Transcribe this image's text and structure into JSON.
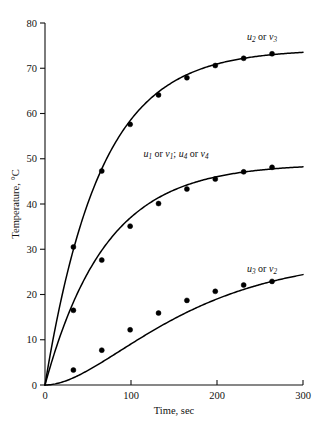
{
  "chart_data": {
    "type": "line",
    "title": "",
    "xlabel": "Time, sec",
    "ylabel": "Temperature, °C",
    "xlim": [
      0,
      300
    ],
    "ylim": [
      0,
      80
    ],
    "xticks": [
      0,
      100,
      200,
      300
    ],
    "xtick_labels": [
      "0",
      "100",
      "200",
      "300"
    ],
    "yticks": [
      0,
      10,
      20,
      30,
      40,
      50,
      60,
      70,
      80
    ],
    "ytick_labels": [
      "0",
      "10",
      "20",
      "30",
      "40",
      "50",
      "60",
      "70",
      "80"
    ],
    "grid": false,
    "legend": "inline-curve-labels",
    "marker": "filled-circle",
    "series": [
      {
        "name": "u2 or v3",
        "label_html": "<tspan class=\"curve-label\">u</tspan><tspan class=\"sub\" dy=\"2.2\">2</tspan><tspan class=\"conj\" dy=\"-2.2\"> or </tspan><tspan>v</tspan><tspan class=\"sub\" dy=\"2.2\">3</tspan>",
        "label_x": 262,
        "label_y": 40,
        "plateau": 74.2,
        "x": [
          0,
          33,
          66,
          99,
          132,
          165,
          198,
          231,
          264
        ],
        "y": [
          0,
          30.5,
          47.3,
          57.6,
          64.1,
          67.9,
          70.6,
          72.2,
          73.2
        ]
      },
      {
        "name": "u1 or v1; u4 or v4",
        "label_html": "<tspan>u</tspan><tspan class=\"sub\" dy=\"2.2\">1</tspan><tspan class=\"conj\" dy=\"-2.2\"> or </tspan><tspan>v</tspan><tspan class=\"sub\" dy=\"2.2\">1</tspan><tspan class=\"conj\" dy=\"-2.2\">; </tspan><tspan>u</tspan><tspan class=\"sub\" dy=\"2.2\">4</tspan><tspan class=\"conj\" dy=\"-2.2\"> or </tspan><tspan>v</tspan><tspan class=\"sub\" dy=\"2.2\">4</tspan>",
        "label_x": 176,
        "label_y": 157,
        "plateau": 48.9,
        "x": [
          0,
          33,
          66,
          99,
          132,
          165,
          198,
          231,
          264
        ],
        "y": [
          0,
          16.5,
          27.6,
          35.1,
          40.1,
          43.3,
          45.5,
          47.1,
          48.1
        ]
      },
      {
        "name": "u3 or v2",
        "label_html": "<tspan>u</tspan><tspan class=\"sub\" dy=\"2.2\">3</tspan><tspan class=\"conj\" dy=\"-2.2\"> or </tspan><tspan>v</tspan><tspan class=\"sub\" dy=\"2.2\">2</tspan>",
        "label_x": 262,
        "label_y": 272,
        "plateau": 23.5,
        "x": [
          0,
          33,
          66,
          99,
          132,
          165,
          198,
          231,
          264
        ],
        "y": [
          0,
          3.3,
          7.7,
          12.2,
          15.9,
          18.7,
          20.7,
          22.1,
          22.9
        ]
      }
    ]
  },
  "axes": {
    "x_label": "Time, sec",
    "y_label": "Temperature, °C"
  },
  "colors": {
    "curve": "#000000",
    "axis": "#111111",
    "background": "#ffffff"
  }
}
